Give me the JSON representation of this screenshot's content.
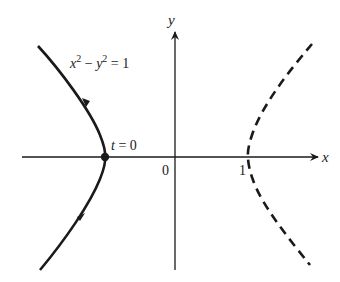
{
  "figure": {
    "axis_labels": {
      "x": "x",
      "y": "y"
    },
    "tick_labels": {
      "origin": "0",
      "one": "1"
    },
    "equation": {
      "lhs_x": "x",
      "exp": "2",
      "minus": " − ",
      "lhs_y": "y",
      "rhs": " = 1"
    },
    "point_label": {
      "var": "t",
      "rest": " = 0"
    },
    "curves": [
      {
        "name": "left-branch",
        "style": "solid",
        "direction": "upward",
        "vertex": [
          -1,
          0
        ]
      },
      {
        "name": "right-branch",
        "style": "dashed",
        "vertex": [
          1,
          0
        ]
      }
    ],
    "colors": {
      "ink": "#1a1a1a",
      "background": "#ffffff"
    }
  }
}
